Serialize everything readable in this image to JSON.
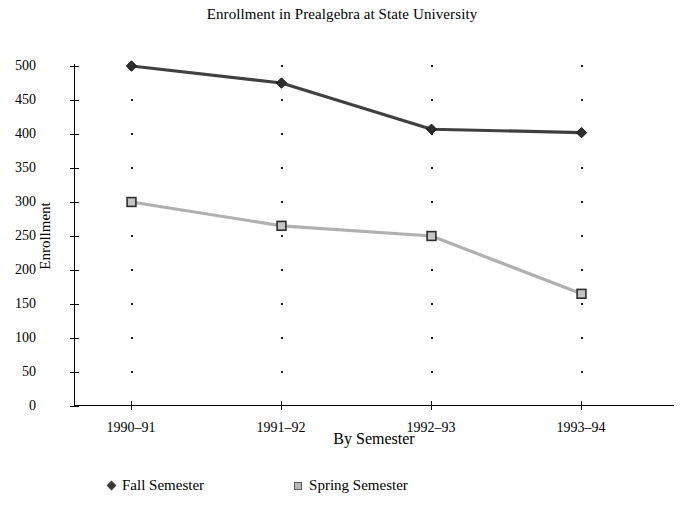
{
  "chart_data": {
    "type": "line",
    "title": "Enrollment in Prealgebra at State University",
    "xlabel": "By Semester",
    "ylabel": "Enrollment",
    "categories": [
      "1990–91",
      "1991–92",
      "1992–93",
      "1993–94"
    ],
    "series": [
      {
        "name": "Fall Semester",
        "values": [
          500,
          475,
          407,
          402
        ],
        "color": "#404040",
        "marker": "diamond"
      },
      {
        "name": "Spring Semester",
        "values": [
          300,
          265,
          250,
          165
        ],
        "color": "#b0b0b0",
        "marker": "square"
      }
    ],
    "ylim": [
      0,
      500
    ],
    "yticks": [
      0,
      50,
      100,
      150,
      200,
      250,
      300,
      350,
      400,
      450,
      500
    ],
    "ytick_labels": [
      "0",
      "50",
      "100",
      "150",
      "200",
      "250",
      "300",
      "350",
      "400",
      "450",
      "500"
    ],
    "grid": "dotted-vertical-at-categories",
    "legend_position": "bottom"
  },
  "legend": {
    "items": [
      {
        "label": "Fall Semester",
        "marker": "diamond-marker-icon"
      },
      {
        "label": "Spring Semester",
        "marker": "square-marker-icon"
      }
    ]
  }
}
